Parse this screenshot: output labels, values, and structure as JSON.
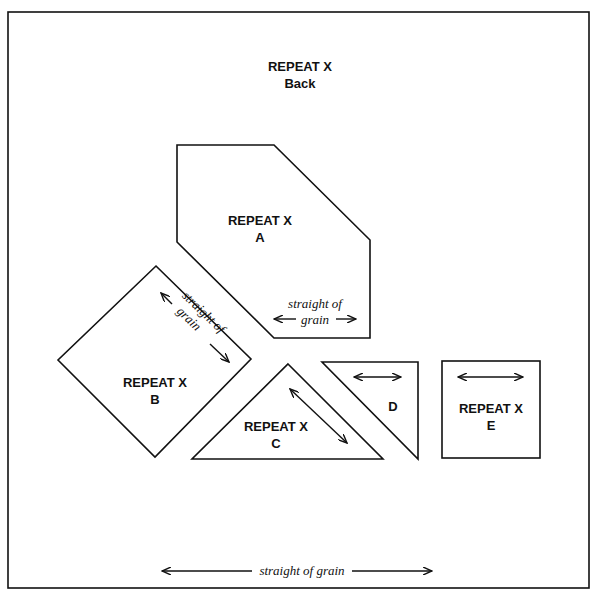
{
  "diagram": {
    "title_line1": "REPEAT X",
    "title_line2": "Back",
    "pieces": [
      {
        "id": "A",
        "line1": "REPEAT X",
        "line2": "A",
        "grain_line1": "straight of",
        "grain_line2": "grain"
      },
      {
        "id": "B",
        "line1": "REPEAT X",
        "line2": "B",
        "grain_line1": "straight of",
        "grain_line2": "grain"
      },
      {
        "id": "C",
        "line1": "REPEAT X",
        "line2": "C"
      },
      {
        "id": "D",
        "line1": "D"
      },
      {
        "id": "E",
        "line1": "REPEAT X",
        "line2": "E"
      }
    ],
    "bottom_grain_label": "straight of grain"
  }
}
